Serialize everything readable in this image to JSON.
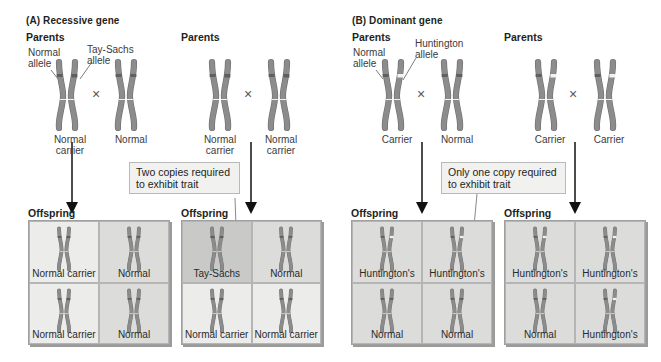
{
  "colors": {
    "chromosome": "#8c8c8c",
    "chromosome_edge": "#6e6e6e",
    "band_dark": "#5f5f5f",
    "band_light": "#f2f2f2",
    "cell_light": "#ececea",
    "cell_mid": "#dcdcdb",
    "cell_dark": "#c9c9c8",
    "note_bg": "#f1f1ef"
  },
  "panels": [
    {
      "title": "(A)  Recessive gene",
      "crosses": [
        {
          "parents_header": "Parents",
          "parent1": {
            "label": "Normal\ncarrier",
            "type": "recessive-carrier"
          },
          "parent2": {
            "label": "Normal",
            "type": "normal"
          },
          "callouts": [
            "Normal\nallele",
            "Tay-Sachs\nallele"
          ],
          "cross_symbol": "×",
          "offspring_header": "Offspring",
          "offspring": [
            {
              "label": "Normal carrier",
              "type": "recessive-carrier",
              "shade": "light"
            },
            {
              "label": "Normal",
              "type": "normal",
              "shade": "mid"
            },
            {
              "label": "Normal carrier",
              "type": "recessive-carrier",
              "shade": "light"
            },
            {
              "label": "Normal",
              "type": "normal",
              "shade": "mid"
            }
          ]
        },
        {
          "parents_header": "Parents",
          "parent1": {
            "label": "Normal\ncarrier",
            "type": "recessive-carrier"
          },
          "parent2": {
            "label": "Normal\ncarrier",
            "type": "recessive-carrier"
          },
          "cross_symbol": "×",
          "note": "Two copies required\nto exhibit trait",
          "offspring_header": "Offspring",
          "offspring": [
            {
              "label": "Tay-Sachs",
              "type": "recessive-affected",
              "shade": "dark"
            },
            {
              "label": "Normal",
              "type": "normal",
              "shade": "mid"
            },
            {
              "label": "Normal carrier",
              "type": "recessive-carrier",
              "shade": "light"
            },
            {
              "label": "Normal carrier",
              "type": "recessive-carrier",
              "shade": "light"
            }
          ]
        }
      ]
    },
    {
      "title": "(B)  Dominant gene",
      "crosses": [
        {
          "parents_header": "Parents",
          "parent1": {
            "label": "Carrier",
            "type": "dominant-carrier"
          },
          "parent2": {
            "label": "Normal",
            "type": "normal"
          },
          "callouts": [
            "Normal\nallele",
            "Huntington\nallele"
          ],
          "cross_symbol": "×",
          "note": "Only one copy required\nto exhibit trait",
          "offspring_header": "Offspring",
          "offspring": [
            {
              "label": "Huntington's",
              "type": "dominant-carrier",
              "shade": "mid"
            },
            {
              "label": "Huntington's",
              "type": "dominant-carrier",
              "shade": "mid"
            },
            {
              "label": "Normal",
              "type": "normal",
              "shade": "mid"
            },
            {
              "label": "Normal",
              "type": "normal",
              "shade": "mid"
            }
          ]
        },
        {
          "parents_header": "Parents",
          "parent1": {
            "label": "Carrier",
            "type": "dominant-carrier"
          },
          "parent2": {
            "label": "Carrier",
            "type": "dominant-carrier"
          },
          "cross_symbol": "×",
          "offspring_header": "Offspring",
          "offspring": [
            {
              "label": "Huntington's",
              "type": "dominant-carrier",
              "shade": "mid"
            },
            {
              "label": "Huntington's",
              "type": "dominant-carrier",
              "shade": "mid"
            },
            {
              "label": "Normal",
              "type": "normal",
              "shade": "mid"
            },
            {
              "label": "Huntington's",
              "type": "dominant-carrier",
              "shade": "mid"
            }
          ]
        }
      ]
    }
  ]
}
